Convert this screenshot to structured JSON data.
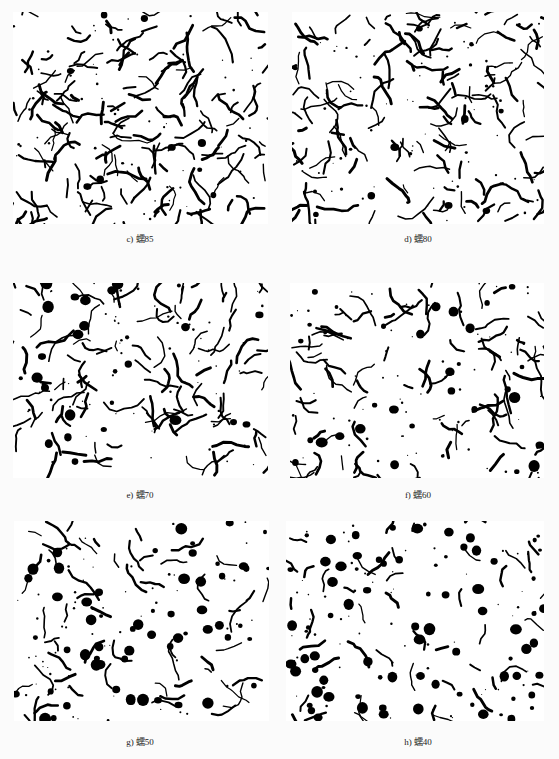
{
  "figure": {
    "panels": [
      {
        "id": "c",
        "caption": "c) 蠕85",
        "style": "vermicular-dense",
        "nodules": 10,
        "worms": 150,
        "seed": 11
      },
      {
        "id": "d",
        "caption": "d) 蠕80",
        "style": "vermicular-dense",
        "nodules": 18,
        "worms": 130,
        "seed": 23
      },
      {
        "id": "e",
        "caption": "e) 蠕70",
        "style": "mixed",
        "nodules": 28,
        "worms": 100,
        "seed": 37
      },
      {
        "id": "f",
        "caption": "f) 蠕60",
        "style": "mixed",
        "nodules": 32,
        "worms": 85,
        "seed": 41
      },
      {
        "id": "g",
        "caption": "g) 蠕50",
        "style": "nodular",
        "nodules": 60,
        "worms": 55,
        "seed": 53
      },
      {
        "id": "h",
        "caption": "h) 蠕40",
        "style": "nodular",
        "nodules": 80,
        "worms": 45,
        "seed": 67
      }
    ],
    "colors": {
      "graphite": "#000000",
      "matrix": "#ffffff",
      "page": "#fbfbfb"
    }
  }
}
